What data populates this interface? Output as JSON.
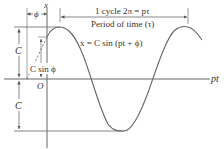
{
  "diagram": {
    "labels": {
      "x_axis": "x",
      "t_axis": "pt",
      "origin": "O",
      "phase": "ϕ",
      "amplitude_top": "C",
      "amplitude_bottom": "C",
      "c_sin_phi": "C sin ϕ",
      "equation": "x = C sin (pt + ϕ)",
      "cycle_line1": "1 cycle 2π = pτ",
      "cycle_line2": "Period of time (τ)"
    },
    "colors": {
      "line": "#555555",
      "curve": "#666666",
      "text": "#333333",
      "background": "#ffffff"
    }
  }
}
